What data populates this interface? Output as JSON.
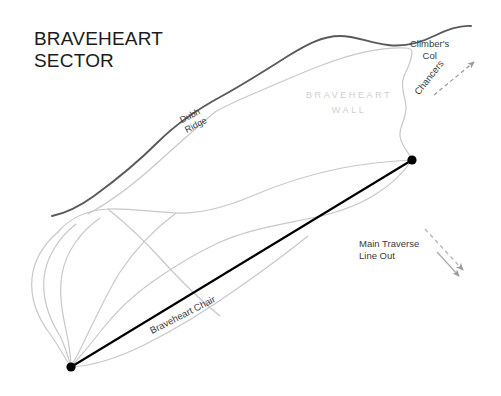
{
  "map": {
    "title": "BRAVEHEART\nSECTOR",
    "background_color": "#ffffff",
    "ridge_color": "#5a5a5a",
    "contour_color": "#c8c8c8",
    "route_color": "#000000",
    "wall_text_color": "#cfcfcf",
    "label_color": "#3a3a3a",
    "labels": {
      "climbers_col": "Climber's\nCol",
      "chancers": "Chancers",
      "braveheart_wall": "BRAVEHEART\nWALL",
      "dubh_ridge": "Dubh\nRidge",
      "main_traverse": "Main Traverse\nLine Out",
      "braveheart_chair": "Braveheart Chair"
    },
    "features": {
      "route_line_name": "Braveheart Chair",
      "route_start_point": "71,367",
      "route_end_point": "412,160",
      "ridge_name": "Dubh Ridge",
      "wall_name": "Braveheart Wall",
      "col_name": "Climber's Col",
      "descent_name": "Chancers",
      "exit_name": "Main Traverse Line Out"
    }
  }
}
